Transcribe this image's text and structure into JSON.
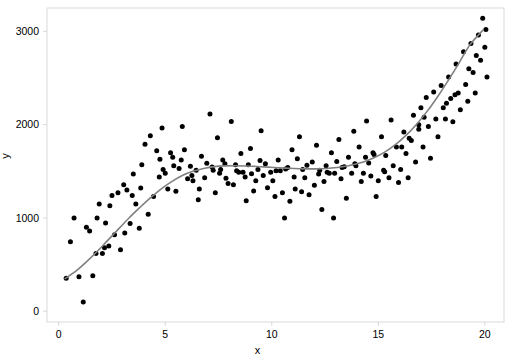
{
  "chart_data": {
    "type": "scatter",
    "title": "",
    "xlabel": "x",
    "ylabel": "y",
    "xlim": [
      -0.55,
      20.9
    ],
    "ylim": [
      -115,
      3250
    ],
    "xticks": [
      0,
      5,
      10,
      15,
      20
    ],
    "xticklabels": [
      "0",
      "5",
      "10",
      "15",
      "20"
    ],
    "yticks": [
      0,
      1000,
      2000,
      3000
    ],
    "yticklabels": [
      "0",
      "1000",
      "2000",
      "3000"
    ],
    "grid": false,
    "legend": null,
    "point_color": "#000000",
    "point_radius": 2.5,
    "curve_color": "#808080",
    "curve_width": 1.6,
    "panel_border_color": "#d9d9d9",
    "background": "#ffffff",
    "series": [
      {
        "name": "observations",
        "type": "scatter",
        "x": [
          0.35,
          0.55,
          0.72,
          0.95,
          1.15,
          1.3,
          1.45,
          1.6,
          1.75,
          1.9,
          2.05,
          2.2,
          2.35,
          2.5,
          2.62,
          2.78,
          2.9,
          3.05,
          3.2,
          3.35,
          3.5,
          3.62,
          3.78,
          3.9,
          4.05,
          4.2,
          4.3,
          4.45,
          4.6,
          4.72,
          4.85,
          5.0,
          5.12,
          5.25,
          5.4,
          5.5,
          5.65,
          5.8,
          5.9,
          6.05,
          6.18,
          6.3,
          6.45,
          6.55,
          6.7,
          6.85,
          6.95,
          7.1,
          7.2,
          7.35,
          7.45,
          7.6,
          7.7,
          7.85,
          7.95,
          8.1,
          8.2,
          8.3,
          8.45,
          8.55,
          8.65,
          8.8,
          8.9,
          9.0,
          9.15,
          9.25,
          9.35,
          9.5,
          9.6,
          9.7,
          9.8,
          9.95,
          10.05,
          10.15,
          10.3,
          10.4,
          10.5,
          10.6,
          10.75,
          10.85,
          10.95,
          11.05,
          11.2,
          11.3,
          11.4,
          11.55,
          11.65,
          11.75,
          11.9,
          12.0,
          12.1,
          12.2,
          12.35,
          12.45,
          12.55,
          12.7,
          12.8,
          12.9,
          13.05,
          13.15,
          13.25,
          13.4,
          13.5,
          13.6,
          13.75,
          13.85,
          13.95,
          14.1,
          14.2,
          14.3,
          14.45,
          14.55,
          14.65,
          14.8,
          14.9,
          15.0,
          15.15,
          15.25,
          15.35,
          15.5,
          15.6,
          15.7,
          15.85,
          15.95,
          16.05,
          16.2,
          16.3,
          16.4,
          16.55,
          16.65,
          16.75,
          16.9,
          17.0,
          17.1,
          17.25,
          17.35,
          17.45,
          17.6,
          17.7,
          17.8,
          17.95,
          18.05,
          18.15,
          18.3,
          18.4,
          18.5,
          18.65,
          18.75,
          18.85,
          19.0,
          19.1,
          19.2,
          19.35,
          19.45,
          19.55,
          19.7,
          19.8,
          19.9,
          20.0,
          20.1,
          1.8,
          2.4,
          3.1,
          4.75,
          5.35,
          6.6,
          7.55,
          8.35,
          9.45,
          10.2,
          11.1,
          12.25,
          13.3,
          14.4,
          15.3,
          16.1,
          17.15,
          18.2,
          19.25,
          20.05,
          2.15,
          3.45,
          4.9,
          6.25,
          7.8,
          9.05,
          10.65,
          12.6,
          14.75,
          16.45,
          18.6,
          19.6,
          5.75,
          8.75,
          11.45,
          13.9,
          16.9,
          3.85,
          7.25,
          12.95
        ],
        "y": [
          355,
          745,
          1000,
          370,
          100,
          900,
          860,
          380,
          620,
          1150,
          620,
          945,
          700,
          1240,
          820,
          1270,
          660,
          1355,
          1300,
          940,
          1470,
          1150,
          890,
          1570,
          1790,
          1040,
          1880,
          1230,
          1720,
          1440,
          1965,
          1480,
          1310,
          1700,
          1560,
          1285,
          1530,
          1980,
          1730,
          1420,
          1555,
          1400,
          1510,
          1195,
          1660,
          1430,
          1585,
          2115,
          1545,
          1270,
          1860,
          1520,
          1620,
          1425,
          1370,
          2035,
          1355,
          1570,
          1490,
          1690,
          1490,
          1185,
          1570,
          1745,
          1290,
          1400,
          1520,
          1935,
          1455,
          1580,
          1325,
          1490,
          1400,
          1230,
          1620,
          1505,
          1270,
          1000,
          1540,
          1180,
          1730,
          1440,
          1635,
          1870,
          1280,
          1430,
          1565,
          1250,
          1600,
          1350,
          1780,
          1470,
          1090,
          1390,
          1560,
          1480,
          1700,
          1000,
          1605,
          1840,
          1420,
          1550,
          1210,
          1650,
          1480,
          1930,
          1560,
          1760,
          1390,
          1480,
          2040,
          1590,
          1450,
          1680,
          1230,
          1400,
          1870,
          1510,
          1670,
          1430,
          2050,
          1560,
          1760,
          1380,
          1520,
          1920,
          1690,
          1430,
          1830,
          2100,
          1600,
          1950,
          2180,
          1760,
          2290,
          1980,
          1640,
          2350,
          2060,
          1870,
          2420,
          2180,
          2060,
          2510,
          2280,
          2030,
          2650,
          2340,
          2160,
          2780,
          2430,
          2250,
          2870,
          2560,
          2340,
          2960,
          2690,
          3140,
          2830,
          2510,
          1000,
          1130,
          840,
          1630,
          1650,
          1310,
          1480,
          1505,
          1615,
          1505,
          1310,
          1510,
          1540,
          1650,
          1495,
          1760,
          2080,
          2230,
          2600,
          3020,
          680,
          1240,
          1520,
          1455,
          1580,
          1475,
          1525,
          1490,
          1700,
          1855,
          2320,
          2740,
          1620,
          1440,
          1520,
          1580,
          2000,
          1320,
          1510,
          1480
        ]
      },
      {
        "name": "fitted-curve",
        "type": "line",
        "x": [
          0.3,
          0.8,
          1.3,
          1.8,
          2.3,
          2.8,
          3.3,
          3.8,
          4.3,
          4.8,
          5.3,
          5.8,
          6.3,
          6.8,
          7.3,
          7.8,
          8.3,
          8.8,
          9.3,
          9.8,
          10.3,
          10.8,
          11.3,
          11.8,
          12.3,
          12.8,
          13.3,
          13.8,
          14.3,
          14.8,
          15.3,
          15.8,
          16.3,
          16.8,
          17.3,
          17.8,
          18.3,
          18.8,
          19.3,
          19.9
        ],
        "y": [
          350,
          430,
          530,
          640,
          760,
          880,
          1000,
          1110,
          1215,
          1310,
          1390,
          1455,
          1500,
          1530,
          1550,
          1558,
          1560,
          1557,
          1552,
          1545,
          1538,
          1532,
          1528,
          1526,
          1528,
          1535,
          1548,
          1570,
          1600,
          1645,
          1705,
          1785,
          1885,
          2005,
          2145,
          2305,
          2480,
          2665,
          2855,
          3010
        ]
      }
    ]
  }
}
